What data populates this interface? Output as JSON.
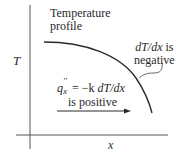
{
  "diagram": {
    "colors": {
      "line": "#2a2a2a",
      "axis": "#555555",
      "background": "#ffffff"
    },
    "axes": {
      "y_label": "T",
      "x_label": "x"
    },
    "profile_label": {
      "line1": "Temperature",
      "line2": "profile"
    },
    "slope_label": {
      "expr": "dT/dx",
      "suffix": " is",
      "line2": "negative"
    },
    "flux_label": {
      "q": "q",
      "sup": "''",
      "sub": "x",
      "equation": " = −k ",
      "expr": "dT/dx",
      "line2": "is positive"
    },
    "arrow": {
      "direction": "right",
      "meaning": "heat-flux-direction"
    }
  }
}
